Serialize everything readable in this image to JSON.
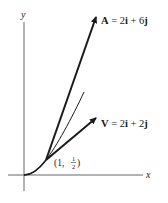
{
  "axes": {
    "x_label": "x",
    "y_label": "y"
  },
  "point": {
    "label_open": "(1, ",
    "label_num": "1",
    "label_den": "2",
    "label_close": ")"
  },
  "vectors": [
    {
      "name": "A",
      "label_bold": "A",
      "label_rest": " = 2",
      "comp1": "i",
      "mid": " + 6",
      "comp2": "j"
    },
    {
      "name": "V",
      "label_bold": "V",
      "label_rest": " = 2",
      "comp1": "i",
      "mid": " + 2",
      "comp2": "j"
    }
  ],
  "colors": {
    "ink": "#1a1a1a",
    "axis": "#555555",
    "background": "#ffffff"
  }
}
